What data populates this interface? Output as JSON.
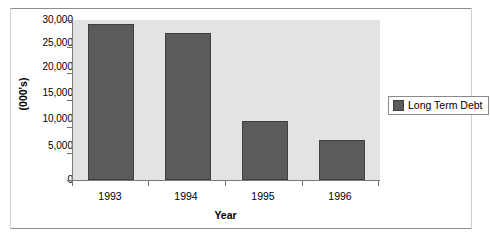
{
  "chart_data": {
    "type": "bar",
    "title": "",
    "categories": [
      "1993",
      "1994",
      "1995",
      "1996"
    ],
    "values": [
      29250,
      27560,
      11060,
      7500
    ],
    "series": [
      {
        "name": "Long Term Debt",
        "values": [
          29250,
          27560,
          11060,
          7500
        ],
        "color": "#5b5b5b"
      }
    ],
    "xlabel": "Year",
    "ylabel": "(000's)",
    "ylim": [
      0,
      30000
    ],
    "ytick_values": [
      0,
      5000,
      10000,
      15000,
      20000,
      25000,
      30000
    ],
    "ytick_labels": [
      "0",
      "5,000",
      "10,000",
      "15,000",
      "20,000",
      "25,000",
      "30,000"
    ],
    "grid": false,
    "legend_position": "right",
    "legend_entries": [
      "Long Term Debt"
    ],
    "plot_background": "#e3e3e1",
    "figure_background": "#ffffff",
    "axis_color": "#7a7a7a"
  },
  "legend": {
    "items": [
      {
        "label": "Long Term Debt",
        "swatch": "legend-swatch-icon"
      }
    ]
  }
}
